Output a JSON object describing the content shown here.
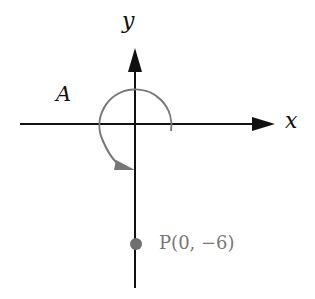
{
  "diagram": {
    "axes": {
      "x_label": "x",
      "y_label": "y",
      "color": "#111111"
    },
    "angle_label": "A",
    "angle_arc": {
      "description": "rotation arc from positive x-axis counterclockwise to negative y-axis",
      "color": "#777777"
    },
    "point": {
      "label": "P(0, −6)",
      "color": "#6f6f6f"
    }
  }
}
